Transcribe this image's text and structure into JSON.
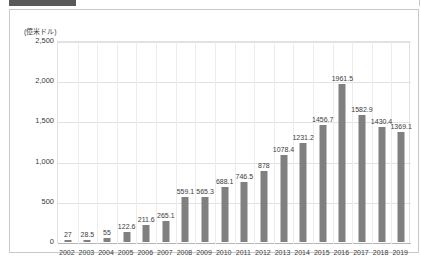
{
  "top_strip": {
    "visible": true,
    "dark_block_color": "#595959"
  },
  "chart_data": {
    "type": "bar",
    "title": "",
    "subtitle": "",
    "unit_label": "(億米ドル)",
    "xlabel": "",
    "ylabel": "",
    "ylim": [
      0,
      2500
    ],
    "ytick_labels": [
      "2,500",
      "2,000",
      "1,500",
      "1,000",
      "500",
      "0"
    ],
    "ytick_values": [
      2500,
      2000,
      1500,
      1000,
      500,
      0
    ],
    "grid": "both-light",
    "legend": "none",
    "bar_color": "#808080",
    "categories": [
      "2002",
      "2003",
      "2004",
      "2005",
      "2006",
      "2007",
      "2008",
      "2009",
      "2010",
      "2011",
      "2012",
      "2013",
      "2014",
      "2015",
      "2016",
      "2017",
      "2018",
      "2019"
    ],
    "values": [
      27,
      28.5,
      55,
      122.6,
      211.6,
      265.1,
      559.1,
      565.3,
      688.1,
      746.5,
      878,
      1078.4,
      1231.2,
      1456.7,
      1961.5,
      1582.9,
      1430.4,
      1369.1
    ],
    "data_labels": [
      "27",
      "28.5",
      "55",
      "122.6",
      "211.6",
      "265.1",
      "559.1",
      "565.3",
      "688.1",
      "746.5",
      "878",
      "1078.4",
      "1231.2",
      "1456.7",
      "1961.5",
      "1582.9",
      "1430.4",
      "1369.1"
    ]
  }
}
